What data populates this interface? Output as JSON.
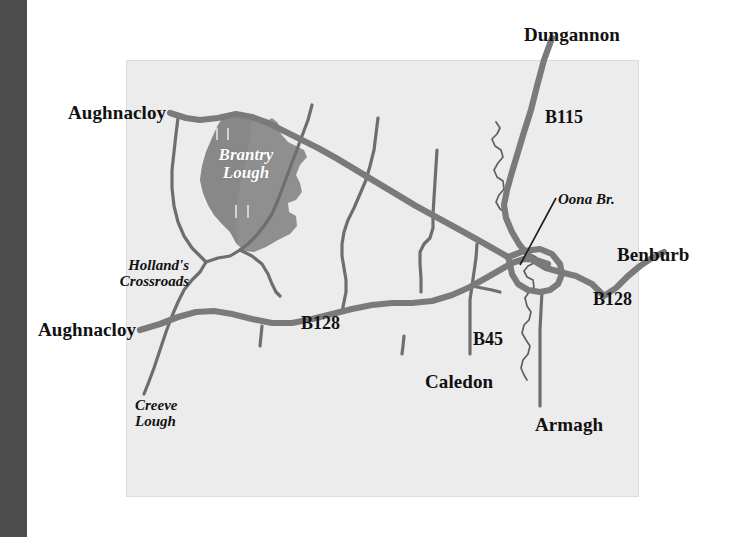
{
  "figure": {
    "kind": "locator-map",
    "region": "Brantry Lough area, County Tyrone / Armagh, Northern Ireland"
  },
  "colors": {
    "gutter": "#4d4d4d",
    "map_background": "#ececec",
    "map_border": "#dcdcdc",
    "road": "#7a7a7a",
    "minor_road": "#6e6e6e",
    "lough_fill": "#8f8f8f",
    "lough_fill_dark": "#848484",
    "stream": "#5f5f5f",
    "label_text": "#111111",
    "lough_label_text": "#ffffff"
  },
  "labels": {
    "towns": [
      {
        "id": "aughnacloy-north",
        "text": "Aughnacloy",
        "x": 68,
        "y": 103
      },
      {
        "id": "dungannon",
        "text": "Dungannon",
        "x": 524,
        "y": 25
      },
      {
        "id": "benburb",
        "text": "Benburb",
        "x": 617,
        "y": 245
      },
      {
        "id": "aughnacloy-south",
        "text": "Aughnacloy",
        "x": 38,
        "y": 320
      },
      {
        "id": "caledon",
        "text": "Caledon",
        "x": 425,
        "y": 372
      },
      {
        "id": "armagh",
        "text": "Armagh",
        "x": 535,
        "y": 415
      }
    ],
    "roads": [
      {
        "id": "b115",
        "text": "B115",
        "x": 545,
        "y": 108
      },
      {
        "id": "b128-west",
        "text": "B128",
        "x": 301,
        "y": 314
      },
      {
        "id": "b128-east",
        "text": "B128",
        "x": 593,
        "y": 290
      },
      {
        "id": "b45",
        "text": "B45",
        "x": 473,
        "y": 330
      }
    ],
    "features": [
      {
        "id": "brantry-lough",
        "text": "Brantry\nLough",
        "line1": "Brantry",
        "line2": "Lough",
        "x": 240,
        "y": 148
      },
      {
        "id": "hollands-crossroads",
        "text": "Holland's\nCrossroads",
        "line1": "Holland's",
        "line2": "Crossroads",
        "x": 97,
        "y": 258
      },
      {
        "id": "creeve-lough",
        "text": "Creeve\nLough",
        "line1": "Creeve",
        "line2": "Lough",
        "x": 135,
        "y": 398
      },
      {
        "id": "oona-br",
        "text": "Oona Br.",
        "line1": "Oona Br.",
        "line2": "",
        "x": 558,
        "y": 192
      }
    ]
  },
  "map_panel": {
    "x": 126,
    "y": 60,
    "width": 513,
    "height": 437
  },
  "geometry": {
    "lough_outline": "M 225,114 L 238,112 L 252,117 L 264,123 L 272,118 L 278,123 L 281,134 L 288,142 L 296,146 L 304,150 L 307,157 L 300,165 L 296,175 L 300,183 L 302,192 L 296,200 L 288,203 L 289,212 L 296,216 L 297,226 L 290,234 L 278,240 L 266,247 L 254,252 L 244,251 L 236,243 L 230,232 L 222,224 L 214,215 L 208,205 L 203,193 L 200,180 L 202,166 L 206,152 L 212,138 L 218,125 Z",
    "roads_major": [
      "M 170,113 L 186,118 L 200,120 L 218,118 L 236,114 L 252,117 L 268,123 L 284,131 L 300,139 L 318,148 L 336,158 L 356,170 L 376,182 L 396,194 L 416,206 L 438,218 L 460,230 L 478,240 L 494,249 L 508,257",
      "M 552,38 L 544,60 L 537,86 L 531,110 L 524,132 L 518,152 L 512,172 L 507,190 L 504,205 L 506,218 L 512,232 L 519,244 L 527,254 L 536,262 L 546,268 L 560,272 L 576,276 L 592,284 L 604,296 L 616,288 L 628,276 L 640,266 L 652,258 L 664,252",
      "M 140,330 L 160,324 L 178,317 L 196,312 L 214,311 L 232,314 L 252,319 L 272,323 L 292,323 L 312,319 L 332,314 L 352,309 L 372,305 L 392,303 L 412,303 L 432,301 L 452,295 L 470,287 L 486,278 L 500,270 L 512,263 L 524,259 L 536,260 L 548,264",
      "M 508,257 L 524,251 L 540,249 L 552,254 L 560,264 L 562,274 L 558,284 L 550,290 L 540,292 L 528,290 L 518,284 L 512,274 L 510,264 Z"
    ],
    "roads_minor": [
      "M 178,118 L 176,134 L 174,152 L 172,170 L 172,188 L 174,206 L 178,222 L 184,236 L 192,248 L 200,256 L 206,262",
      "M 312,105 L 308,120 L 302,136 L 296,152 L 290,168 L 284,184 L 278,200 L 272,214 L 264,226 L 256,236 L 248,244 L 240,250",
      "M 378,118 L 376,134 L 374,150 L 370,166 L 366,180 L 360,194 L 354,208 L 348,220 L 344,232 L 342,244 L 342,256 L 344,268 L 346,280 L 346,292 L 344,302 L 342,312",
      "M 437,150 L 436,166 L 435,182 L 434,198 L 433,214 L 433,228 L 430,238 L 424,244 L 420,252 L 420,264 L 421,278 L 421,292",
      "M 206,262 L 200,272 L 192,280 L 184,290 L 178,302 L 172,316 L 166,332 L 160,350 L 154,368 L 148,384 L 144,394",
      "M 206,262 L 218,258 L 230,256 L 240,250",
      "M 240,250 L 252,256 L 262,264 L 268,274 L 272,284 L 276,292 L 280,296",
      "M 262,326 L 261,336 L 260,346",
      "M 477,244 L 476,258 L 474,272 L 472,286 L 470,300 L 470,314 L 470,328 L 470,342 L 470,354",
      "M 472,286 L 482,288 L 492,290 L 500,292",
      "M 542,292 L 541,310 L 540,330 L 540,350 L 540,370 L 540,390 L 540,406",
      "M 404,336 L 403,346 L 402,354"
    ],
    "stream": [
      "M 496,122 L 500,128 L 497,134 L 492,139 L 495,146 L 501,150 L 503,157 L 498,163 L 494,170 L 497,177 L 503,181 L 504,189 L 499,195 L 496,202 L 500,209 L 506,213 L 509,220 L 512,228 L 516,236 L 520,243",
      "M 520,243 L 524,250 L 530,254 L 536,257 L 534,263 L 528,266 L 524,271 L 527,277 L 533,280 L 534,287 L 529,292 L 525,298",
      "M 525,298 L 527,306 L 531,312 L 529,320 L 524,325 L 522,333 L 526,340 L 530,346 L 528,354 L 523,360 L 521,368 L 524,375 L 527,380"
    ],
    "oona_leader": "M 556,198 L 520,265",
    "lough_inner_marks": [
      "M 217,128 L 217,140",
      "M 228,128 L 228,140",
      "M 236,205 L 236,218",
      "M 248,205 L 248,218"
    ]
  }
}
